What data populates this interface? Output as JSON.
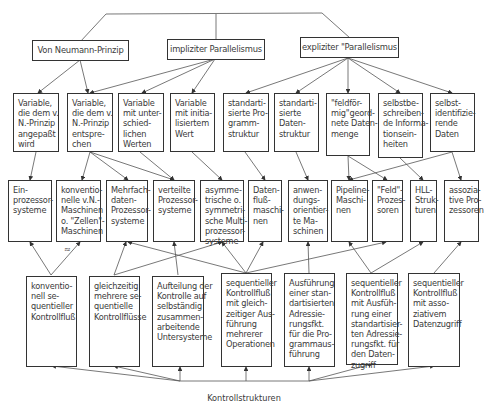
{
  "diagram": {
    "top_level": [
      {
        "id": "vn",
        "label": "Von Neumann-Prinzip"
      },
      {
        "id": "imp",
        "label": "impliziter Parallelismus"
      },
      {
        "id": "exp",
        "label": "expliziter \"Parallelismus"
      }
    ],
    "row2": [
      {
        "label": "Variable,\ndie dem v.\nN.-Prinzip\nangepaßt\nwird"
      },
      {
        "label": "Variable,\ndie dem v.\nN.-Prinzip\nentspre-\nchen"
      },
      {
        "label": "Variable\nmit unter-\nschied-\nlichen\nWerten"
      },
      {
        "label": "Variable\nmit initia-\nlisiertem\nWert"
      },
      {
        "label": "standarti-\nsierte Pro-\ngramm-\nstruktur"
      },
      {
        "label": "standarti-\nsierte\nDaten-\nstruktur"
      },
      {
        "label": "\"feldför-\nmig\"geord-\nnete Daten-\nmenge"
      },
      {
        "label": "selbstbe-\nschreiben-\nde Informa-\ntionsein-\nheiten"
      },
      {
        "label": "selbst-\nidentifizie-\nrende\nDaten"
      }
    ],
    "row3": [
      {
        "label": "Ein-\nprozessor-\nsysteme"
      },
      {
        "label": "konventio-\nnelle v.N.-\nMaschinen\no. \"Zellen\"-\nMaschinen"
      },
      {
        "label": "Mehrfach-\ndaten-\nProzessor-\nsysteme"
      },
      {
        "label": "verteilte\nProzessor-\nsysteme"
      },
      {
        "label": "asymme-\ntrische o.\nsymmetri-\nsche Multi-\nprozessor-\nsysteme"
      },
      {
        "label": "Daten-\nfluß-\nmaschi-\nnen"
      },
      {
        "label": "anwen-\ndungs-\norientier-\nte Ma-\nschinen"
      },
      {
        "label": "Pipeline-\nMaschi-\nnen"
      },
      {
        "label": "\"Feld\"-\nProzes-\nsoren"
      },
      {
        "label": "HLL-\nStruk-\nturen"
      },
      {
        "label": "assozia-\ntive Pro-\nzessoren"
      }
    ],
    "row4": [
      {
        "label": "konventio-\nnell se-\nquentieller\nKontrollfluß"
      },
      {
        "label": "gleichzeitig\nmehrere se-\nquentielle\nKontrollflüsse"
      },
      {
        "label": "Aufteilung der\nKontrolle auf\nselbständig\nzusammen-\narbeitende\nUntersysteme"
      },
      {
        "label": "sequentieller\nKontrollfluß\nmit gleich-\nzeitiger Aus-\nführung\nmehrerer\nOperationen"
      },
      {
        "label": "Ausführung\neiner stan-\ndartisierten\nAdressie-\nrungsfkt.\nfür die Pro-\ngrammaus-\nführung"
      },
      {
        "label": "sequentieller\nKontrollfluß\nmit Ausfüh-\nrung einer\nstandartisier-\nten Adressie-\nrungsfkt. für\nden Daten-\nzugriff"
      },
      {
        "label": "sequentieller\nKontrollfluß\nmit asso-\nziativem\nDatenzugriff"
      }
    ],
    "footer_label": "Kontrollstrukturen",
    "stray_mark": "≈"
  }
}
